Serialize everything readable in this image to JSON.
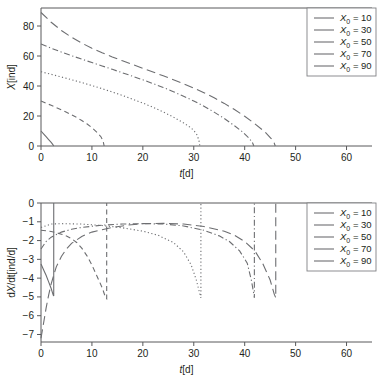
{
  "figure": {
    "background": "#ffffff",
    "line_color": "#6d6e71",
    "axis_color": "#58595b",
    "text_color": "#231f20"
  },
  "chart_data": [
    {
      "type": "line",
      "panel": "top",
      "title": "",
      "xlabel": "t[d]",
      "ylabel": "X[ind]",
      "xlim": [
        0,
        65
      ],
      "ylim": [
        0,
        92
      ],
      "xticks": [
        0,
        10,
        20,
        30,
        40,
        50,
        60
      ],
      "yticks": [
        0,
        20,
        40,
        60,
        80
      ],
      "grid": false,
      "legend_position": "top-right",
      "series": [
        {
          "name": "X0 = 10",
          "x0": 10,
          "style": "solid",
          "extinction_time": 2.5,
          "points": [
            [
              0,
              10
            ],
            [
              0.5,
              8.1
            ],
            [
              1,
              6.2
            ],
            [
              1.5,
              4.3
            ],
            [
              2,
              2.4
            ],
            [
              2.3,
              1.1
            ],
            [
              2.5,
              0
            ]
          ]
        },
        {
          "name": "X0 = 30",
          "x0": 30,
          "style": "dash",
          "extinction_time": 12.4,
          "points": [
            [
              0,
              30
            ],
            [
              1,
              28.5
            ],
            [
              2,
              27.1
            ],
            [
              3,
              25.6
            ],
            [
              4,
              24.1
            ],
            [
              5,
              22.5
            ],
            [
              6,
              20.8
            ],
            [
              7,
              19.0
            ],
            [
              8,
              17.0
            ],
            [
              9,
              14.8
            ],
            [
              10,
              12.2
            ],
            [
              11,
              9.1
            ],
            [
              11.8,
              6.0
            ],
            [
              12.2,
              3.2
            ],
            [
              12.4,
              0
            ]
          ]
        },
        {
          "name": "X0 = 50",
          "x0": 50,
          "style": "dot",
          "extinction_time": 31.2,
          "points": [
            [
              0,
              49.5
            ],
            [
              2,
              47.8
            ],
            [
              4,
              46.0
            ],
            [
              6,
              44.2
            ],
            [
              8,
              42.3
            ],
            [
              10,
              40.3
            ],
            [
              12,
              38.2
            ],
            [
              14,
              36.0
            ],
            [
              16,
              33.7
            ],
            [
              18,
              31.2
            ],
            [
              20,
              28.6
            ],
            [
              22,
              25.8
            ],
            [
              24,
              22.7
            ],
            [
              26,
              19.3
            ],
            [
              28,
              15.4
            ],
            [
              29.5,
              12.0
            ],
            [
              30.5,
              8.4
            ],
            [
              31.0,
              4.0
            ],
            [
              31.2,
              0
            ]
          ]
        },
        {
          "name": "X0 = 70",
          "x0": 70,
          "style": "dashdot",
          "extinction_time": 41.8,
          "points": [
            [
              0,
              68.0
            ],
            [
              2,
              65.2
            ],
            [
              4,
              62.6
            ],
            [
              6,
              60.2
            ],
            [
              8,
              57.9
            ],
            [
              10,
              55.6
            ],
            [
              12,
              53.4
            ],
            [
              14,
              51.1
            ],
            [
              16,
              48.8
            ],
            [
              18,
              46.5
            ],
            [
              20,
              44.1
            ],
            [
              22,
              41.6
            ],
            [
              24,
              39.0
            ],
            [
              26,
              36.2
            ],
            [
              28,
              33.2
            ],
            [
              30,
              30.0
            ],
            [
              32,
              26.5
            ],
            [
              34,
              22.6
            ],
            [
              36,
              18.3
            ],
            [
              38,
              13.5
            ],
            [
              39.5,
              9.6
            ],
            [
              40.8,
              5.4
            ],
            [
              41.5,
              2.4
            ],
            [
              41.8,
              0
            ]
          ]
        },
        {
          "name": "X0 = 90",
          "x0": 90,
          "style": "longdash",
          "extinction_time": 46.0,
          "points": [
            [
              0,
              89.0
            ],
            [
              2,
              82.5
            ],
            [
              4,
              77.0
            ],
            [
              6,
              72.5
            ],
            [
              8,
              68.6
            ],
            [
              10,
              65.2
            ],
            [
              12,
              62.2
            ],
            [
              14,
              59.4
            ],
            [
              16,
              56.8
            ],
            [
              18,
              54.3
            ],
            [
              20,
              51.8
            ],
            [
              22,
              49.3
            ],
            [
              24,
              46.8
            ],
            [
              26,
              44.2
            ],
            [
              28,
              41.5
            ],
            [
              30,
              38.6
            ],
            [
              32,
              35.5
            ],
            [
              34,
              32.1
            ],
            [
              36,
              28.4
            ],
            [
              38,
              24.3
            ],
            [
              40,
              19.8
            ],
            [
              42,
              14.8
            ],
            [
              44,
              9.3
            ],
            [
              45.2,
              5.0
            ],
            [
              45.8,
              2.0
            ],
            [
              46.0,
              0
            ]
          ]
        }
      ]
    },
    {
      "type": "line",
      "panel": "bottom",
      "title": "",
      "xlabel": "t[d]",
      "ylabel": "dX/dt[ind/d]",
      "xlim": [
        0,
        65
      ],
      "ylim": [
        -7.4,
        0
      ],
      "xticks": [
        0,
        10,
        20,
        30,
        40,
        50,
        60
      ],
      "yticks": [
        0,
        -1,
        -2,
        -3,
        -4,
        -5,
        -6,
        -7
      ],
      "grid": false,
      "legend_position": "top-right",
      "series": [
        {
          "name": "X0 = 10",
          "x0": 10,
          "style": "solid",
          "extinction_time": 2.5,
          "points": [
            [
              0,
              -3.25
            ],
            [
              0.5,
              -3.55
            ],
            [
              1,
              -3.85
            ],
            [
              1.5,
              -4.2
            ],
            [
              2,
              -4.55
            ],
            [
              2.4,
              -4.9
            ],
            [
              2.5,
              -4.95
            ],
            [
              2.5,
              0
            ]
          ]
        },
        {
          "name": "X0 = 30",
          "x0": 30,
          "style": "dash",
          "extinction_time": 12.9,
          "points": [
            [
              0,
              -1.45
            ],
            [
              1,
              -1.48
            ],
            [
              2,
              -1.52
            ],
            [
              3,
              -1.58
            ],
            [
              4,
              -1.66
            ],
            [
              5,
              -1.76
            ],
            [
              6,
              -1.9
            ],
            [
              7,
              -2.1
            ],
            [
              8,
              -2.4
            ],
            [
              9,
              -2.8
            ],
            [
              10,
              -3.3
            ],
            [
              11,
              -3.9
            ],
            [
              12,
              -4.5
            ],
            [
              12.7,
              -5.05
            ],
            [
              12.9,
              -5.1
            ],
            [
              12.9,
              0
            ]
          ]
        },
        {
          "name": "X0 = 50",
          "x0": 50,
          "style": "dot",
          "extinction_time": 31.4,
          "points": [
            [
              0,
              -1.3
            ],
            [
              2,
              -1.12
            ],
            [
              4,
              -1.1
            ],
            [
              8,
              -1.12
            ],
            [
              12,
              -1.2
            ],
            [
              16,
              -1.32
            ],
            [
              20,
              -1.5
            ],
            [
              23,
              -1.72
            ],
            [
              26,
              -2.1
            ],
            [
              28,
              -2.6
            ],
            [
              29.5,
              -3.3
            ],
            [
              30.5,
              -4.1
            ],
            [
              31.2,
              -4.85
            ],
            [
              31.4,
              -5.05
            ],
            [
              31.4,
              0
            ]
          ]
        },
        {
          "name": "X0 = 70",
          "x0": 70,
          "style": "dashdot",
          "extinction_time": 41.9,
          "points": [
            [
              0,
              -2.45
            ],
            [
              1,
              -2.05
            ],
            [
              2,
              -1.82
            ],
            [
              4,
              -1.55
            ],
            [
              6,
              -1.4
            ],
            [
              8,
              -1.3
            ],
            [
              12,
              -1.18
            ],
            [
              16,
              -1.12
            ],
            [
              20,
              -1.1
            ],
            [
              24,
              -1.12
            ],
            [
              28,
              -1.22
            ],
            [
              32,
              -1.45
            ],
            [
              35,
              -1.75
            ],
            [
              37,
              -2.05
            ],
            [
              39,
              -2.55
            ],
            [
              40.5,
              -3.2
            ],
            [
              41.3,
              -4.1
            ],
            [
              41.8,
              -4.85
            ],
            [
              41.9,
              -5.05
            ],
            [
              41.9,
              0
            ]
          ]
        },
        {
          "name": "X0 = 90",
          "x0": 90,
          "style": "longdash",
          "extinction_time": 46.1,
          "points": [
            [
              0,
              -7.2
            ],
            [
              0.5,
              -6.4
            ],
            [
              1,
              -5.6
            ],
            [
              1.5,
              -4.9
            ],
            [
              2,
              -4.3
            ],
            [
              3,
              -3.4
            ],
            [
              4,
              -2.85
            ],
            [
              5,
              -2.45
            ],
            [
              6,
              -2.15
            ],
            [
              8,
              -1.78
            ],
            [
              10,
              -1.55
            ],
            [
              12,
              -1.42
            ],
            [
              14,
              -1.3
            ],
            [
              17,
              -1.18
            ],
            [
              20,
              -1.1
            ],
            [
              24,
              -1.08
            ],
            [
              28,
              -1.12
            ],
            [
              32,
              -1.25
            ],
            [
              36,
              -1.5
            ],
            [
              38,
              -1.72
            ],
            [
              40,
              -2.05
            ],
            [
              42,
              -2.55
            ],
            [
              43.5,
              -3.2
            ],
            [
              45,
              -4.1
            ],
            [
              45.8,
              -4.85
            ],
            [
              46.1,
              -5.05
            ],
            [
              46.1,
              0
            ]
          ]
        }
      ]
    }
  ],
  "legend": {
    "entries": [
      {
        "symbol": "X",
        "subscript": "0",
        "equals": "=",
        "value": "10",
        "style": "solid"
      },
      {
        "symbol": "X",
        "subscript": "0",
        "equals": "=",
        "value": "30",
        "style": "dash"
      },
      {
        "symbol": "X",
        "subscript": "0",
        "equals": "=",
        "value": "50",
        "style": "dot"
      },
      {
        "symbol": "X",
        "subscript": "0",
        "equals": "=",
        "value": "70",
        "style": "dashdot"
      },
      {
        "symbol": "X",
        "subscript": "0",
        "equals": "=",
        "value": "90",
        "style": "longdash"
      }
    ]
  },
  "axis_labels": {
    "top_x": "t[d]",
    "top_y": "X[ind]",
    "bottom_x": "t[d]",
    "bottom_y": "dX/dt[ind/d]"
  }
}
